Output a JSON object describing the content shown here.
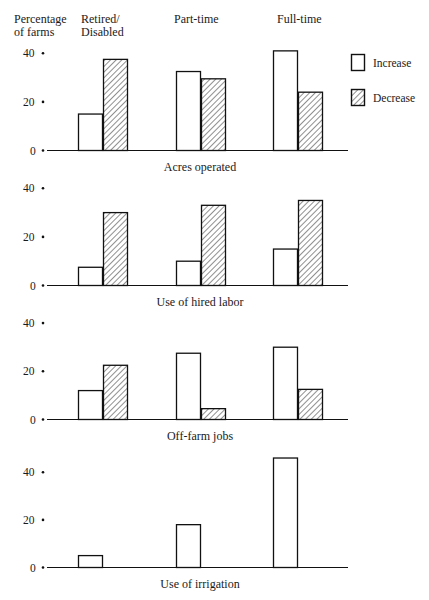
{
  "chart_data": {
    "type": "bar",
    "title": "",
    "ylabel": "Percentage of farms",
    "xlabel": "",
    "ylim": [
      0,
      40
    ],
    "yticks": [
      0,
      20,
      40
    ],
    "grid": false,
    "legend": {
      "position": "right",
      "entries": [
        {
          "name": "Increase",
          "fill": "white"
        },
        {
          "name": "Decrease",
          "fill": "hatched"
        }
      ]
    },
    "categories": [
      "Retired/ Disabled",
      "Part-time",
      "Full-time"
    ],
    "panels": [
      {
        "label": "Acres operated",
        "series": [
          {
            "name": "Increase",
            "values": [
              15,
              32.5,
              41
            ]
          },
          {
            "name": "Decrease",
            "values": [
              37.5,
              29.5,
              24
            ]
          }
        ]
      },
      {
        "label": "Use of hired labor",
        "series": [
          {
            "name": "Increase",
            "values": [
              7.5,
              10,
              15
            ]
          },
          {
            "name": "Decrease",
            "values": [
              30,
              33,
              35
            ]
          }
        ]
      },
      {
        "label": "Off-farm jobs",
        "series": [
          {
            "name": "Increase",
            "values": [
              12,
              27.5,
              30
            ]
          },
          {
            "name": "Decrease",
            "values": [
              22.5,
              4.5,
              12.5
            ]
          }
        ]
      },
      {
        "label": "Use of irrigation",
        "series": [
          {
            "name": "Increase",
            "values": [
              5,
              18,
              46
            ]
          },
          {
            "name": "Decrease",
            "values": [
              null,
              null,
              null
            ]
          }
        ]
      }
    ]
  },
  "header": {
    "ylabel_line1": "Percentage",
    "ylabel_line2": "of farms",
    "cat0_line1": "Retired/",
    "cat0_line2": "Disabled",
    "cat1": "Part-time",
    "cat2": "Full-time"
  },
  "legend": {
    "increase": "Increase",
    "decrease": "Decrease"
  },
  "ticks": [
    "0",
    "20",
    "40"
  ],
  "panel_labels": [
    "Acres operated",
    "Use of hired labor",
    "Off-farm jobs",
    "Use of irrigation"
  ]
}
